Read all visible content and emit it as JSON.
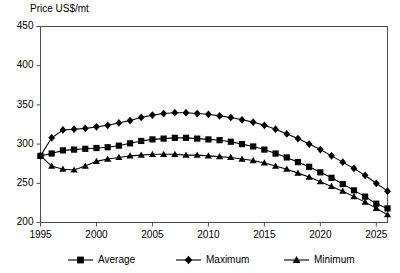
{
  "chart_data": {
    "type": "line",
    "title": "",
    "ylabel": "Price US$/mt",
    "xlabel": "",
    "ylim": [
      200,
      450
    ],
    "xlim": [
      1995,
      2026
    ],
    "yticks": [
      200,
      250,
      300,
      350,
      400,
      450
    ],
    "xticks": [
      1995,
      2000,
      2005,
      2010,
      2015,
      2020,
      2025
    ],
    "grid": false,
    "legend_position": "bottom",
    "x": [
      1995,
      1996,
      1997,
      1998,
      1999,
      2000,
      2001,
      2002,
      2003,
      2004,
      2005,
      2006,
      2007,
      2008,
      2009,
      2010,
      2011,
      2012,
      2013,
      2014,
      2015,
      2016,
      2017,
      2018,
      2019,
      2020,
      2021,
      2022,
      2023,
      2024,
      2025,
      2026
    ],
    "series": [
      {
        "name": "Average",
        "marker": "square",
        "values": [
          285,
          288,
          292,
          293,
          294,
          295,
          296,
          298,
          301,
          304,
          306,
          307,
          308,
          308,
          307,
          306,
          305,
          303,
          300,
          297,
          293,
          288,
          283,
          277,
          271,
          264,
          257,
          249,
          241,
          233,
          224,
          218
        ]
      },
      {
        "name": "Maximum",
        "marker": "diamond",
        "values": [
          285,
          308,
          318,
          319,
          320,
          322,
          324,
          327,
          330,
          334,
          337,
          339,
          340,
          340,
          339,
          338,
          336,
          334,
          331,
          328,
          324,
          319,
          313,
          307,
          300,
          293,
          285,
          277,
          269,
          260,
          250,
          240
        ]
      },
      {
        "name": "Minimum",
        "marker": "triangle",
        "values": [
          285,
          272,
          268,
          267,
          272,
          278,
          281,
          283,
          285,
          286,
          287,
          287,
          287,
          286,
          286,
          285,
          284,
          283,
          281,
          279,
          276,
          272,
          268,
          263,
          258,
          252,
          246,
          240,
          233,
          226,
          218,
          210
        ]
      }
    ]
  },
  "legend": {
    "items": [
      {
        "label": "Average",
        "marker": "square"
      },
      {
        "label": "Maximum",
        "marker": "diamond"
      },
      {
        "label": "Minimum",
        "marker": "triangle"
      }
    ]
  },
  "colors": {
    "series": "#000000",
    "axis": "#4d4d4d",
    "background": "#ffffff",
    "text": "#000000"
  }
}
